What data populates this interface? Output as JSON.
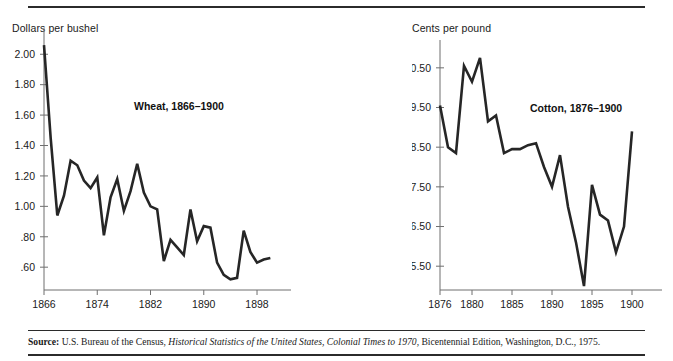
{
  "figure": {
    "source_label": "Source:",
    "source_text_1": " U.S. Bureau of the Census, ",
    "source_italic": "Historical Statistics of the United States, Colonial Times to 1970",
    "source_text_2": ", Bicentennial Edition, Washington, D.C., 1975."
  },
  "colors": {
    "line": "#262626",
    "axis": "#6f6f6f",
    "rule": "#2b2b2b",
    "text": "#1a1a1a",
    "background": "#ffffff"
  },
  "chart_data": [
    {
      "type": "line",
      "title": "Wheat, 1866–1900",
      "xlabel": "",
      "ylabel": "Dollars per bushel",
      "ylim": [
        0.45,
        2.12
      ],
      "xlim": [
        1866,
        1901
      ],
      "grid": false,
      "legend": "none",
      "ytick_labels": [
        "2.00",
        "1.80",
        "1.60",
        "1.40",
        "1.20",
        "1.00",
        ".80",
        ".60"
      ],
      "ytick_values": [
        2.0,
        1.8,
        1.6,
        1.4,
        1.2,
        1.0,
        0.8,
        0.6
      ],
      "xtick_labels": [
        "1866",
        "1874",
        "1882",
        "1890",
        "1898"
      ],
      "xtick_values": [
        1866,
        1874,
        1882,
        1890,
        1898
      ],
      "x": [
        1866,
        1867,
        1868,
        1869,
        1870,
        1871,
        1872,
        1873,
        1874,
        1875,
        1876,
        1877,
        1878,
        1879,
        1880,
        1881,
        1882,
        1883,
        1884,
        1885,
        1886,
        1887,
        1888,
        1889,
        1890,
        1891,
        1892,
        1893,
        1894,
        1895,
        1896,
        1897,
        1898,
        1899,
        1900
      ],
      "values": [
        2.06,
        1.45,
        0.94,
        1.07,
        1.3,
        1.27,
        1.17,
        1.12,
        1.19,
        0.81,
        1.06,
        1.18,
        0.97,
        1.1,
        1.28,
        1.09,
        1.0,
        0.98,
        0.64,
        0.78,
        0.73,
        0.68,
        0.98,
        0.77,
        0.87,
        0.86,
        0.63,
        0.55,
        0.52,
        0.53,
        0.84,
        0.7,
        0.63,
        0.65,
        0.66
      ]
    },
    {
      "type": "line",
      "title": "Cotton, 1876–1900",
      "xlabel": "",
      "ylabel": "Cents per pound",
      "ylim": [
        4.9,
        11.0
      ],
      "xlim": [
        1876,
        1902
      ],
      "grid": false,
      "legend": "none",
      "ytick_labels": [
        "10.50",
        "9.50",
        "8.50",
        "7.50",
        "6.50",
        "5.50"
      ],
      "ytick_values": [
        10.5,
        9.5,
        8.5,
        7.5,
        6.5,
        5.5
      ],
      "xtick_labels": [
        "1876",
        "1880",
        "1885",
        "1890",
        "1895",
        "1900"
      ],
      "xtick_values": [
        1876,
        1880,
        1885,
        1890,
        1895,
        1900
      ],
      "x": [
        1876,
        1877,
        1878,
        1879,
        1880,
        1881,
        1882,
        1883,
        1884,
        1885,
        1886,
        1887,
        1888,
        1889,
        1890,
        1891,
        1892,
        1893,
        1894,
        1895,
        1896,
        1897,
        1898,
        1899,
        1900
      ],
      "values": [
        9.55,
        8.5,
        8.35,
        10.55,
        10.15,
        10.75,
        9.15,
        9.3,
        8.35,
        8.45,
        8.45,
        8.55,
        8.6,
        8.0,
        7.5,
        8.3,
        7.0,
        6.1,
        5.0,
        7.55,
        6.8,
        6.65,
        5.85,
        6.5,
        8.9
      ]
    }
  ]
}
